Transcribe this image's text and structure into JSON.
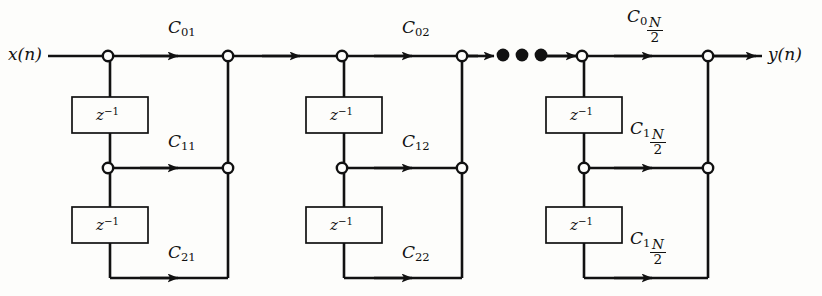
{
  "figure": {
    "kind": "signal-flow-diagram",
    "canvas": {
      "width": 822,
      "height": 296,
      "background": "#fdfdfb",
      "ink": "#111111"
    }
  },
  "io": {
    "input_label": "x(n)",
    "output_label": "y(n)"
  },
  "delay_label": {
    "base": "z",
    "exponent": "−1"
  },
  "ellipsis": {
    "dots": 3,
    "meaning": "additional identical sections continue"
  },
  "sections": [
    {
      "id": "section-1",
      "index": 1,
      "left_node_x": 108,
      "right_node_x": 228,
      "coefficients": [
        {
          "row": "top",
          "base": "C",
          "sub": "01",
          "fraction": null,
          "text": "C01"
        },
        {
          "row": "middle",
          "base": "C",
          "sub": "11",
          "fraction": null,
          "text": "C11"
        },
        {
          "row": "bottom",
          "base": "C",
          "sub": "21",
          "fraction": null,
          "text": "C21"
        }
      ],
      "delays": 2
    },
    {
      "id": "section-2",
      "index": 2,
      "left_node_x": 342,
      "right_node_x": 462,
      "coefficients": [
        {
          "row": "top",
          "base": "C",
          "sub": "02",
          "fraction": null,
          "text": "C02"
        },
        {
          "row": "middle",
          "base": "C",
          "sub": "12",
          "fraction": null,
          "text": "C12"
        },
        {
          "row": "bottom",
          "base": "C",
          "sub": "22",
          "fraction": null,
          "text": "C22"
        }
      ],
      "delays": 2
    },
    {
      "id": "section-last",
      "index": "N/2",
      "left_node_x": 582,
      "right_node_x": 708,
      "coefficients": [
        {
          "row": "top",
          "base": "C",
          "sub": "0",
          "fraction": {
            "num": "N",
            "den": "2"
          },
          "text": "C0 N/2"
        },
        {
          "row": "middle",
          "base": "C",
          "sub": "1",
          "fraction": {
            "num": "N",
            "den": "2"
          },
          "text": "C1 N/2"
        },
        {
          "row": "bottom",
          "base": "C",
          "sub": "1",
          "fraction": {
            "num": "N",
            "den": "2"
          },
          "text": "C1 N/2"
        }
      ],
      "delays": 2
    }
  ],
  "geometry": {
    "row_y": {
      "top": 56,
      "middle": 168,
      "bottom": 278
    },
    "delay_box": {
      "width": 76,
      "height": 36,
      "row1_top": 97,
      "row2_top": 207
    },
    "node_radius": 5.2,
    "line_width": 2.6
  }
}
